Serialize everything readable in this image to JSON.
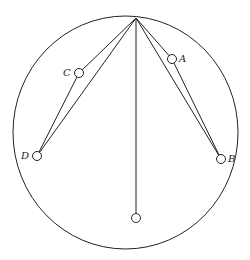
{
  "diagram": {
    "colors": {
      "stroke": "#222222",
      "background": "#ffffff"
    },
    "outer_circle": {
      "cx": 125.5,
      "cy": 132.5,
      "rx": 112.5,
      "ry": 116.5
    },
    "apex": {
      "x": 136,
      "y": 18
    },
    "rings": [
      {
        "id": "A",
        "label": "A",
        "cx": 172,
        "cy": 59,
        "r": 4.5,
        "label_x": 179,
        "label_y": 62
      },
      {
        "id": "B",
        "label": "B",
        "cx": 221,
        "cy": 159,
        "r": 4.5,
        "label_x": 228,
        "label_y": 161
      },
      {
        "id": "C",
        "label": "C",
        "cx": 79,
        "cy": 73,
        "r": 4.5,
        "label_x": 63,
        "label_y": 76
      },
      {
        "id": "D",
        "label": "D",
        "cx": 37,
        "cy": 156,
        "r": 4.5,
        "label_x": 21,
        "label_y": 159
      },
      {
        "id": "bottom",
        "label": "",
        "cx": 136,
        "cy": 218,
        "r": 4.5
      }
    ],
    "labels": {
      "A": "A",
      "B": "B",
      "C": "C",
      "D": "D"
    }
  }
}
